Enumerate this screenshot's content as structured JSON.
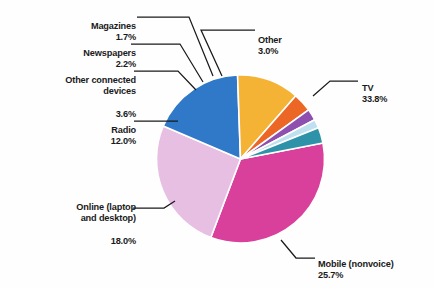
{
  "chart_data": {
    "type": "pie",
    "title": "",
    "subtitle": "",
    "xlabel": "",
    "ylabel": "",
    "legend_position": "callout-labels",
    "grid": false,
    "units": "percent",
    "total": 100.0,
    "start_angle_deg": -11,
    "direction": "clockwise",
    "categories": [
      "TV",
      "Mobile (nonvoice)",
      "Online (laptop and desktop)",
      "Radio",
      "Other connected devices",
      "Newspapers",
      "Magazines",
      "Other"
    ],
    "values": [
      33.8,
      25.7,
      18.0,
      12.0,
      3.6,
      2.2,
      1.7,
      3.0
    ],
    "labels": [
      "33.8%",
      "25.7%",
      "18.0%",
      "12.0%",
      "3.6%",
      "2.2%",
      "1.7%",
      "3.0%"
    ],
    "colors": [
      "#d9409b",
      "#e7bfe3",
      "#2f79c8",
      "#f5b335",
      "#ec6625",
      "#8e4fae",
      "#bfe0ef",
      "#2e93a8"
    ],
    "slices": [
      {
        "name": "TV",
        "label": "TV",
        "percent": "33.8%",
        "value": 33.8,
        "color": "#d9409b"
      },
      {
        "name": "Mobile (nonvoice)",
        "label": "Mobile (nonvoice)",
        "percent": "25.7%",
        "value": 25.7,
        "color": "#e7bfe3"
      },
      {
        "name": "Online (laptop and desktop)",
        "label": "Online (laptop\nand desktop)",
        "percent": "18.0%",
        "value": 18.0,
        "color": "#2f79c8"
      },
      {
        "name": "Radio",
        "label": "Radio",
        "percent": "12.0%",
        "value": 12.0,
        "color": "#f5b335"
      },
      {
        "name": "Other connected devices",
        "label": "Other connected\ndevices",
        "percent": "3.6%",
        "value": 3.6,
        "color": "#ec6625"
      },
      {
        "name": "Newspapers",
        "label": "Newspapers",
        "percent": "2.2%",
        "value": 2.2,
        "color": "#8e4fae"
      },
      {
        "name": "Magazines",
        "label": "Magazines",
        "percent": "1.7%",
        "value": 1.7,
        "color": "#bfe0ef"
      },
      {
        "name": "Other",
        "label": "Other",
        "percent": "3.0%",
        "value": 3.0,
        "color": "#2e93a8"
      }
    ]
  },
  "labels": {
    "magazines": {
      "name": "Magazines",
      "percent": "1.7%"
    },
    "newspapers": {
      "name": "Newspapers",
      "percent": "2.2%"
    },
    "other_connected": {
      "name": "Other connected devices",
      "line1": "Other connected",
      "line2": "devices",
      "percent": "3.6%"
    },
    "radio": {
      "name": "Radio",
      "percent": "12.0%"
    },
    "online": {
      "name": "Online (laptop and desktop)",
      "line1": "Online (laptop",
      "line2": "and desktop)",
      "percent": "18.0%"
    },
    "other": {
      "name": "Other",
      "percent": "3.0%"
    },
    "tv": {
      "name": "TV",
      "percent": "33.8%"
    },
    "mobile": {
      "name": "Mobile (nonvoice)",
      "percent": "25.7%"
    }
  },
  "colors": {
    "background": "#fefefe",
    "text": "#1a1a1a",
    "leader_line": "#1a1a1a",
    "slice_border": "#ffffff"
  }
}
